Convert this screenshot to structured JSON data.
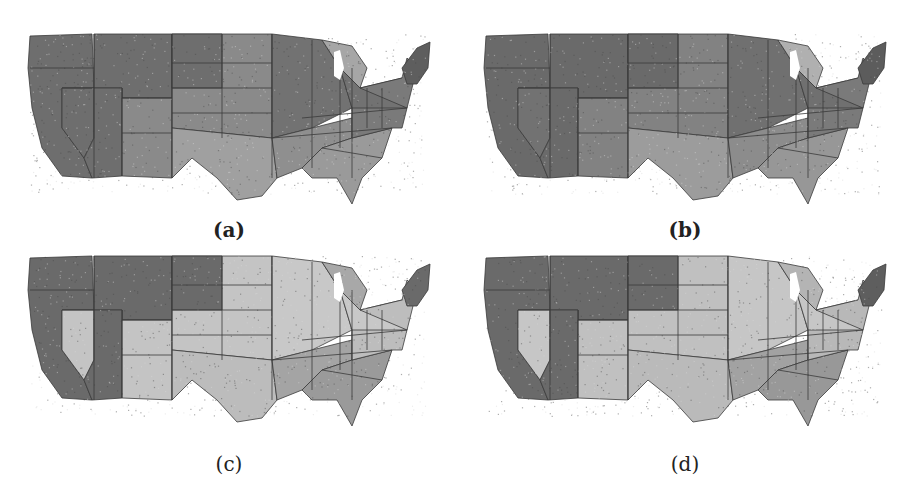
{
  "figure": {
    "panels": [
      {
        "id": "a",
        "label": "(a)",
        "tones": {
          "west": "#6e6e6e",
          "plains": "#8a8a8a",
          "midwest": "#727272",
          "south": "#8f8f8f",
          "southeast": "#9a9a9a",
          "northeast": "#7a7a7a",
          "newengland": "#5e5e5e",
          "texas": "#a0a0a0",
          "nevada": "#6e6e6e",
          "michigan": "#a6a6a6"
        }
      },
      {
        "id": "b",
        "label": "(b)",
        "tones": {
          "west": "#6a6a6a",
          "plains": "#828282",
          "midwest": "#707070",
          "south": "#8c8c8c",
          "southeast": "#979797",
          "northeast": "#7a7a7a",
          "newengland": "#5c5c5c",
          "texas": "#9c9c9c",
          "nevada": "#727272",
          "michigan": "#b0b0b0"
        }
      },
      {
        "id": "c",
        "label": "(c)",
        "tones": {
          "west": "#6a6a6a",
          "plains": "#c4c4c4",
          "midwest": "#c8c8c8",
          "south": "#a4a4a4",
          "southeast": "#9a9a9a",
          "northeast": "#bdbdbd",
          "newengland": "#6a6a6a",
          "texas": "#bcbcbc",
          "nevada": "#c4c4c4",
          "michigan": "#a8a8a8"
        }
      },
      {
        "id": "d",
        "label": "(d)",
        "tones": {
          "west": "#6a6a6a",
          "plains": "#c0c0c0",
          "midwest": "#c6c6c6",
          "south": "#a2a2a2",
          "southeast": "#989898",
          "northeast": "#b8b8b8",
          "newengland": "#5e5e5e",
          "texas": "#bababa",
          "nevada": "#c6c6c6",
          "michigan": "#b4b4b4"
        }
      }
    ]
  }
}
